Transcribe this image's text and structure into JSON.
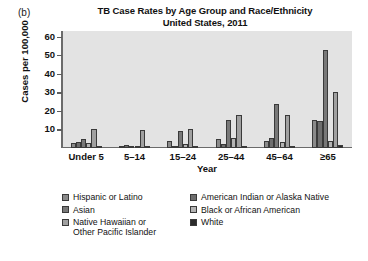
{
  "panel_label": "(b)",
  "chart_data": {
    "type": "bar",
    "title": "TB Case Rates by Age Group and Race/Ethnicity",
    "subtitle": "United States, 2011",
    "title_lines": [
      "TB Case Rates by Age Group and Race/Ethnicity",
      "United States, 2011"
    ],
    "xlabel": "Year",
    "ylabel": "Cases per 100,000",
    "ylim": [
      0,
      63
    ],
    "yticks": [
      10,
      20,
      30,
      40,
      50,
      60
    ],
    "ytick_labels": [
      "10",
      "20",
      "30",
      "40",
      "50",
      "60"
    ],
    "grid": false,
    "legend_position": "below-plot",
    "categories": [
      "Under 5",
      "5–14",
      "15–24",
      "25–44",
      "45–64",
      "≥65"
    ],
    "series": [
      {
        "name": "Hispanic or Latino",
        "color": "#8a8a8a",
        "values": [
          2.6,
          0.8,
          3.6,
          4.6,
          3.8,
          15.2
        ]
      },
      {
        "name": "American Indian or Alaska Native",
        "color": "#6e6e6e",
        "values": [
          3.4,
          1.5,
          1.3,
          2.0,
          5.4,
          14.8
        ]
      },
      {
        "name": "Asian",
        "color": "#787878",
        "values": [
          5.0,
          1.2,
          9.0,
          15.0,
          23.5,
          53.0
        ]
      },
      {
        "name": "Black or African American",
        "color": "#b4b4b4",
        "values": [
          2.5,
          0.5,
          2.0,
          5.5,
          3.2,
          3.6
        ]
      },
      {
        "name": "Native Hawaiian or Other Pacific Islander",
        "color": "#a0a0a0",
        "values": [
          10.0,
          9.5,
          10.5,
          18.0,
          17.8,
          30.0
        ]
      },
      {
        "name": "White",
        "color": "#2b2b2b",
        "values": [
          0.4,
          0.1,
          0.3,
          0.6,
          0.9,
          1.6
        ]
      }
    ]
  },
  "legend": {
    "left_column": [
      {
        "label": "Hispanic or Latino",
        "color": "#8a8a8a"
      },
      {
        "label": "Asian",
        "color": "#787878"
      },
      {
        "label": "Native Hawaiian or\nOther Pacific Islander",
        "color": "#a0a0a0"
      }
    ],
    "right_column": [
      {
        "label": "American Indian or Alaska Native",
        "color": "#6e6e6e"
      },
      {
        "label": "Black or African American",
        "color": "#b4b4b4"
      },
      {
        "label": "White",
        "color": "#2b2b2b"
      }
    ]
  }
}
